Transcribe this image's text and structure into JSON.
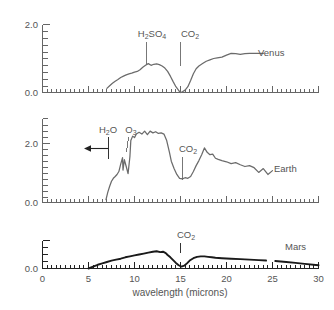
{
  "figure": {
    "xaxis_title": "wavelength (microns)",
    "x_ticks": [
      "0",
      "5",
      "10",
      "15",
      "20",
      "25",
      "30"
    ],
    "panels": [
      {
        "name": "venus",
        "label": "Venus",
        "y_ticks": [
          "2.0",
          "0.0"
        ],
        "annotations": [
          {
            "name": "h2so4",
            "text": "H",
            "sub1": "2",
            "mid": "SO",
            "sub2": "4",
            "x": 11.3
          },
          {
            "name": "co2",
            "text": "CO",
            "sub1": "2",
            "x": 15.0
          }
        ]
      },
      {
        "name": "earth",
        "label": "Earth",
        "y_ticks": [
          "2.0",
          "0.0"
        ],
        "annotations": [
          {
            "name": "h2o",
            "text": "H",
            "sub1": "2",
            "mid": "O",
            "x": 8.2
          },
          {
            "name": "o3",
            "text": "O",
            "sub1": "3",
            "x": 9.6
          },
          {
            "name": "co2",
            "text": "CO",
            "sub1": "2",
            "x": 15.0
          }
        ]
      },
      {
        "name": "mars",
        "label": "Mars",
        "y_ticks": [
          "0.0"
        ],
        "annotations": [
          {
            "name": "co2",
            "text": "CO",
            "sub1": "2",
            "x": 15.0
          }
        ]
      }
    ]
  },
  "chart_data": {
    "type": "line",
    "title": "",
    "xlabel": "wavelength (microns)",
    "ylabel": "",
    "xlim": [
      0,
      30
    ],
    "grid": false,
    "legend": "inline-right-labels",
    "x_ticks": [
      0,
      5,
      10,
      15,
      20,
      25,
      30
    ],
    "panels": [
      {
        "name": "Venus",
        "ylim": [
          0.0,
          2.0
        ],
        "y_ticks": [
          0.0,
          2.0
        ],
        "color": "#6b6b6b",
        "absorption_bands": [
          {
            "species": "H2SO4",
            "wavelength": 11.3
          },
          {
            "species": "CO2",
            "wavelength": 15.0
          }
        ],
        "x": [
          7.0,
          7.3,
          7.6,
          7.9,
          8.2,
          8.5,
          8.8,
          9.1,
          9.4,
          9.7,
          10.0,
          10.3,
          10.6,
          10.9,
          11.2,
          11.5,
          11.8,
          12.1,
          12.4,
          12.7,
          13.0,
          13.3,
          13.6,
          13.9,
          14.2,
          14.5,
          14.8,
          15.0,
          15.2,
          15.5,
          15.8,
          16.1,
          16.4,
          16.7,
          17.0,
          17.4,
          17.8,
          18.2,
          18.6,
          19.0,
          19.5,
          20.0,
          20.5,
          21.0,
          21.5,
          22.0,
          22.5,
          23.0,
          23.5,
          24.0
        ],
        "y": [
          0.12,
          0.2,
          0.27,
          0.33,
          0.38,
          0.44,
          0.48,
          0.52,
          0.55,
          0.57,
          0.6,
          0.62,
          0.67,
          0.74,
          0.8,
          0.85,
          0.8,
          0.83,
          0.84,
          0.82,
          0.78,
          0.72,
          0.62,
          0.48,
          0.32,
          0.17,
          0.06,
          0.0,
          0.02,
          0.07,
          0.17,
          0.35,
          0.55,
          0.7,
          0.78,
          0.85,
          0.92,
          0.96,
          1.0,
          1.02,
          1.04,
          1.1,
          1.15,
          1.14,
          1.12,
          1.14,
          1.15,
          1.15,
          1.15,
          1.15
        ]
      },
      {
        "name": "Earth",
        "ylim": [
          0.0,
          2.6
        ],
        "y_ticks": [
          0.0,
          2.0
        ],
        "color": "#6b6b6b",
        "absorption_bands": [
          {
            "species": "H2O",
            "wavelength": 8.2
          },
          {
            "species": "O3",
            "wavelength": 9.6
          },
          {
            "species": "CO2",
            "wavelength": 15.0
          }
        ],
        "annotation_arrow": {
          "direction": "left",
          "at_wavelength": 8.2,
          "value": 1.7
        },
        "x": [
          6.9,
          7.1,
          7.3,
          7.5,
          7.7,
          7.9,
          8.1,
          8.3,
          8.5,
          8.7,
          8.75,
          8.9,
          9.1,
          9.3,
          9.5,
          9.6,
          9.8,
          10.0,
          10.2,
          10.5,
          10.8,
          11.1,
          11.4,
          11.7,
          12.0,
          12.3,
          12.6,
          12.9,
          13.2,
          13.5,
          13.8,
          14.0,
          14.3,
          14.6,
          14.9,
          15.2,
          15.5,
          15.8,
          16.1,
          16.4,
          16.7,
          17.0,
          17.3,
          17.6,
          17.9,
          18.2,
          18.5,
          18.8,
          19.1,
          19.5,
          20.0,
          20.5,
          21.0,
          21.5,
          22.0,
          22.5,
          23.0,
          23.5,
          24.0,
          24.5,
          25.0
        ],
        "y": [
          0.1,
          0.35,
          0.55,
          0.72,
          0.82,
          0.88,
          0.95,
          1.05,
          1.3,
          1.52,
          1.1,
          1.45,
          1.22,
          0.98,
          1.55,
          2.1,
          2.25,
          2.2,
          2.32,
          2.38,
          2.32,
          2.42,
          2.3,
          2.42,
          2.36,
          2.4,
          2.34,
          2.36,
          2.32,
          2.1,
          1.7,
          1.4,
          1.15,
          0.95,
          0.82,
          0.8,
          0.84,
          0.82,
          0.88,
          1.05,
          1.25,
          1.42,
          1.62,
          1.85,
          1.7,
          1.62,
          1.64,
          1.5,
          1.46,
          1.42,
          1.38,
          1.32,
          1.35,
          1.28,
          1.22,
          1.25,
          1.18,
          1.02,
          1.15,
          0.95,
          1.08
        ]
      },
      {
        "name": "Mars",
        "ylim": [
          0.0,
          0.6
        ],
        "y_ticks": [
          0.0
        ],
        "color": "#1a1a1a",
        "absorption_bands": [
          {
            "species": "CO2",
            "wavelength": 15.0
          }
        ],
        "gap": [
          24.3,
          25.3
        ],
        "x": [
          5.0,
          5.5,
          6.0,
          6.5,
          7.0,
          7.5,
          8.0,
          8.5,
          9.0,
          9.5,
          10.0,
          10.5,
          11.0,
          11.5,
          12.0,
          12.4,
          12.8,
          13.1,
          13.4,
          13.6,
          13.9,
          14.2,
          14.5,
          14.8,
          15.1,
          15.4,
          15.7,
          16.0,
          16.4,
          16.8,
          17.2,
          17.6,
          18.0,
          18.4,
          18.8,
          19.5,
          20.5,
          21.5,
          22.5,
          23.5,
          24.3,
          25.3,
          26.5,
          27.5,
          28.5,
          30.0
        ],
        "y": [
          0.0,
          0.04,
          0.08,
          0.11,
          0.14,
          0.17,
          0.19,
          0.21,
          0.24,
          0.26,
          0.28,
          0.3,
          0.32,
          0.34,
          0.36,
          0.37,
          0.35,
          0.36,
          0.33,
          0.29,
          0.24,
          0.18,
          0.12,
          0.07,
          0.04,
          0.06,
          0.11,
          0.17,
          0.22,
          0.25,
          0.26,
          0.26,
          0.25,
          0.24,
          0.23,
          0.22,
          0.21,
          0.2,
          0.19,
          0.18,
          0.17,
          0.16,
          0.14,
          0.12,
          0.1,
          0.07
        ]
      }
    ]
  }
}
